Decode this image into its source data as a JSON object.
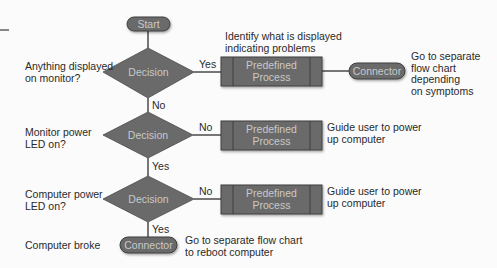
{
  "colors": {
    "shape_fill": "#6a6a6a",
    "shape_border": "#3e3e3e",
    "shape_text": "#c9c9c9",
    "line": "#2e2e2e",
    "text": "#2a2a2a",
    "background": "#fbfbfb"
  },
  "start": {
    "label": "Start"
  },
  "steps": [
    {
      "question": [
        "Anything displayed",
        "on monitor?"
      ],
      "decision_label": "Decision",
      "branch_right_label": "Yes",
      "branch_down_label": "No",
      "process_label": [
        "Predefined",
        "Process"
      ],
      "process_note": [
        "Identify what is displayed",
        "indicating problems"
      ],
      "connector_label": "Connector",
      "connector_note": [
        "Go to separate",
        "flow chart",
        "depending",
        "on symptoms"
      ]
    },
    {
      "question": [
        "Monitor power",
        "LED on?"
      ],
      "decision_label": "Decision",
      "branch_right_label": "No",
      "branch_down_label": "Yes",
      "process_label": [
        "Predefined",
        "Process"
      ],
      "process_note": [
        "Guide user to power",
        "up computer"
      ]
    },
    {
      "question": [
        "Computer power",
        "LED on?"
      ],
      "decision_label": "Decision",
      "branch_right_label": "No",
      "branch_down_label": "Yes",
      "process_label": [
        "Predefined",
        "Process"
      ],
      "process_note": [
        "Guide user to power",
        "up computer"
      ]
    }
  ],
  "end": {
    "label": "Computer broke",
    "connector_label": "Connector",
    "connector_note": [
      "Go to separate flow chart",
      "to reboot computer"
    ]
  }
}
